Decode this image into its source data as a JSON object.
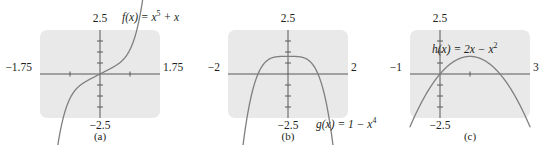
{
  "figure": {
    "panels": [
      {
        "caption": "(a)",
        "equation_html": "<i>f</i>(<i>x</i>) = <i>x</i><sup>5</sup> + <i>x</i>",
        "equation_text": "f(x) = x^5 + x",
        "labels": {
          "top": "2.5",
          "bottom": "−2.5",
          "left": "−1.75",
          "right": "1.75"
        },
        "chart_data": {
          "type": "line",
          "title": "f(x) = x^5 + x",
          "function": "x**5 + x",
          "xlabel": "x",
          "ylabel": "y",
          "xlim": [
            -1.75,
            1.75
          ],
          "ylim": [
            -2.5,
            2.5
          ],
          "grid": false,
          "legend": "none",
          "xticks": [
            -1.75,
            -0.875,
            0,
            0.875,
            1.75
          ],
          "yticks": [
            -2.5,
            -1.875,
            -1.25,
            -0.625,
            0,
            0.625,
            1.25,
            1.875,
            2.5
          ],
          "x": [
            -1.75,
            -1.6,
            -1.45,
            -1.3,
            -1.15,
            -1.0,
            -0.85,
            -0.7,
            -0.55,
            -0.4,
            -0.25,
            -0.1,
            0.0,
            0.1,
            0.25,
            0.4,
            0.55,
            0.7,
            0.85,
            1.0,
            1.15,
            1.3,
            1.45,
            1.6,
            1.75
          ],
          "y": [
            -18.16,
            -12.08,
            -7.86,
            -4.01,
            -2.16,
            -2.0,
            -1.29,
            -0.87,
            -0.6,
            -0.41,
            -0.25,
            -0.1,
            0.0,
            0.1,
            0.25,
            0.41,
            0.6,
            0.87,
            1.29,
            2.0,
            3.16,
            5.01,
            7.86,
            12.08,
            18.16
          ],
          "annotations": [
            "f(x) = x^5 + x"
          ]
        }
      },
      {
        "caption": "(b)",
        "equation_html": "<i>g</i>(<i>x</i>) = 1 − <i>x</i><sup>4</sup>",
        "equation_text": "g(x) = 1 - x^4",
        "labels": {
          "top": "2.5",
          "bottom": "−2.5",
          "left": "−2",
          "right": "2"
        },
        "chart_data": {
          "type": "line",
          "title": "g(x) = 1 - x^4",
          "function": "1 - x**4",
          "xlabel": "x",
          "ylabel": "y",
          "xlim": [
            -2,
            2
          ],
          "ylim": [
            -2.5,
            2.5
          ],
          "grid": false,
          "legend": "none",
          "xticks": [
            -2,
            -1,
            0,
            1,
            2
          ],
          "yticks": [
            -2.5,
            -1.875,
            -1.25,
            -0.625,
            0,
            0.625,
            1.25,
            1.875,
            2.5
          ],
          "x": [
            -2.0,
            -1.8,
            -1.6,
            -1.4,
            -1.3,
            -1.2,
            -1.1,
            -1.0,
            -0.9,
            -0.75,
            -0.6,
            -0.4,
            -0.2,
            0.0,
            0.2,
            0.4,
            0.6,
            0.75,
            0.9,
            1.0,
            1.1,
            1.2,
            1.3,
            1.4,
            1.6,
            1.8,
            2.0
          ],
          "y": [
            -15.0,
            -9.49,
            -5.55,
            -2.84,
            -1.86,
            -1.07,
            -0.46,
            0.0,
            0.34,
            0.68,
            0.87,
            0.97,
            0.998,
            1.0,
            0.998,
            0.97,
            0.87,
            0.68,
            0.34,
            0.0,
            -0.46,
            -1.07,
            -1.86,
            -2.84,
            -5.55,
            -9.49,
            -15.0
          ],
          "annotations": [
            "g(x) = 1 - x^4"
          ]
        }
      },
      {
        "caption": "(c)",
        "equation_html": "<i>h</i>(<i>x</i>) = 2<i>x</i> − <i>x</i><sup>2</sup>",
        "equation_text": "h(x) = 2x - x^2",
        "labels": {
          "top": "2.5",
          "bottom": "−2.5",
          "left": "−1",
          "right": "3"
        },
        "chart_data": {
          "type": "line",
          "title": "h(x) = 2x - x^2",
          "function": "2*x - x**2",
          "xlabel": "x",
          "ylabel": "y",
          "xlim": [
            -1,
            3
          ],
          "ylim": [
            -2.5,
            2.5
          ],
          "grid": false,
          "legend": "none",
          "xticks": [
            -1,
            0,
            1,
            2,
            3
          ],
          "yticks": [
            -2.5,
            -1.875,
            -1.25,
            -0.625,
            0,
            0.625,
            1.25,
            1.875,
            2.5
          ],
          "x": [
            -1.0,
            -0.8,
            -0.6,
            -0.4,
            -0.2,
            0.0,
            0.2,
            0.4,
            0.6,
            0.8,
            1.0,
            1.2,
            1.4,
            1.6,
            1.8,
            2.0,
            2.2,
            2.4,
            2.6,
            2.8,
            3.0
          ],
          "y": [
            -3.0,
            -2.24,
            -1.56,
            -0.96,
            -0.44,
            0.0,
            0.36,
            0.64,
            0.84,
            0.96,
            1.0,
            0.96,
            0.84,
            0.64,
            0.36,
            0.0,
            -0.44,
            -0.96,
            -1.56,
            -2.24,
            -3.0
          ],
          "annotations": [
            "h(x) = 2x - x^2"
          ]
        }
      }
    ],
    "colors": {
      "plot_background": "#e9e9e9",
      "curve": "#7f7f7f",
      "axis": "#58595b",
      "text": "#231f20",
      "page_background": "#ffffff"
    }
  }
}
